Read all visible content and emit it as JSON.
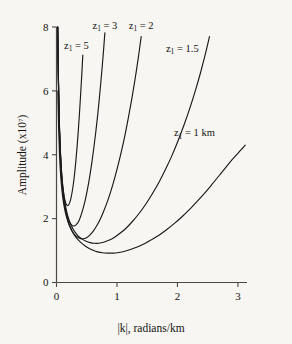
{
  "figure": {
    "background_color": "#f7f6f3",
    "line_color": "#1a1a1a",
    "axis_color": "#4a4744"
  },
  "chart_data": {
    "type": "line",
    "title": "",
    "xlabel": "|k|, radians/km",
    "ylabel": "Amplitude (x10",
    "ylabel_exponent": "7",
    "ylabel_suffix": ")",
    "xlim": [
      0,
      3.15
    ],
    "ylim": [
      0,
      8
    ],
    "xticks": [
      0,
      1,
      2,
      3
    ],
    "xtick_labels": [
      "0",
      "1",
      "2",
      "3"
    ],
    "yticks": [
      0,
      2,
      4,
      6,
      8
    ],
    "ytick_labels": [
      "0",
      "2",
      "4",
      "6",
      "8"
    ],
    "grid": false,
    "legend": "inline-curve-labels",
    "series": [
      {
        "name": "z1 = 5",
        "label_prefix": "z",
        "label_sub": "1",
        "label_value": "= 5",
        "z1": 5,
        "label_x": 0.33,
        "label_y": 7.32,
        "points": [
          [
            0.02,
            8.0
          ],
          [
            0.03,
            6.6
          ],
          [
            0.04,
            5.55
          ],
          [
            0.05,
            4.8
          ],
          [
            0.06,
            4.25
          ],
          [
            0.07,
            3.85
          ],
          [
            0.08,
            3.52
          ],
          [
            0.09,
            3.26
          ],
          [
            0.1,
            3.05
          ],
          [
            0.115,
            2.83
          ],
          [
            0.13,
            2.66
          ],
          [
            0.145,
            2.54
          ],
          [
            0.16,
            2.46
          ],
          [
            0.175,
            2.42
          ],
          [
            0.19,
            2.41
          ],
          [
            0.205,
            2.44
          ],
          [
            0.22,
            2.51
          ],
          [
            0.24,
            2.65
          ],
          [
            0.26,
            2.85
          ],
          [
            0.28,
            3.1
          ],
          [
            0.3,
            3.42
          ],
          [
            0.32,
            3.8
          ],
          [
            0.34,
            4.24
          ],
          [
            0.36,
            4.74
          ],
          [
            0.38,
            5.3
          ],
          [
            0.4,
            5.92
          ],
          [
            0.42,
            6.58
          ],
          [
            0.435,
            7.12
          ]
        ]
      },
      {
        "name": "z1 = 3",
        "label_prefix": "z",
        "label_sub": "1",
        "label_value": "= 3",
        "z1": 3,
        "label_x": 0.8,
        "label_y": 7.95,
        "points": [
          [
            0.02,
            8.0
          ],
          [
            0.03,
            6.55
          ],
          [
            0.04,
            5.45
          ],
          [
            0.05,
            4.7
          ],
          [
            0.065,
            3.9
          ],
          [
            0.08,
            3.38
          ],
          [
            0.095,
            3.0
          ],
          [
            0.11,
            2.72
          ],
          [
            0.13,
            2.46
          ],
          [
            0.15,
            2.26
          ],
          [
            0.17,
            2.11
          ],
          [
            0.19,
            2.0
          ],
          [
            0.215,
            1.89
          ],
          [
            0.24,
            1.82
          ],
          [
            0.265,
            1.78
          ],
          [
            0.29,
            1.77
          ],
          [
            0.315,
            1.79
          ],
          [
            0.345,
            1.85
          ],
          [
            0.375,
            1.95
          ],
          [
            0.405,
            2.1
          ],
          [
            0.44,
            2.32
          ],
          [
            0.475,
            2.58
          ],
          [
            0.51,
            2.9
          ],
          [
            0.545,
            3.27
          ],
          [
            0.58,
            3.7
          ],
          [
            0.615,
            4.18
          ],
          [
            0.65,
            4.72
          ],
          [
            0.685,
            5.32
          ],
          [
            0.715,
            5.9
          ],
          [
            0.745,
            6.52
          ],
          [
            0.775,
            7.2
          ],
          [
            0.8,
            7.82
          ]
        ]
      },
      {
        "name": "z1 = 2",
        "label_prefix": "z",
        "label_sub": "1",
        "label_value": "= 2",
        "z1": 2,
        "label_x": 1.4,
        "label_y": 7.95,
        "points": [
          [
            0.02,
            8.0
          ],
          [
            0.03,
            6.5
          ],
          [
            0.045,
            5.1
          ],
          [
            0.06,
            4.25
          ],
          [
            0.08,
            3.48
          ],
          [
            0.1,
            2.98
          ],
          [
            0.12,
            2.62
          ],
          [
            0.145,
            2.3
          ],
          [
            0.17,
            2.07
          ],
          [
            0.2,
            1.87
          ],
          [
            0.23,
            1.72
          ],
          [
            0.265,
            1.59
          ],
          [
            0.3,
            1.5
          ],
          [
            0.34,
            1.43
          ],
          [
            0.38,
            1.39
          ],
          [
            0.42,
            1.37
          ],
          [
            0.465,
            1.38
          ],
          [
            0.51,
            1.42
          ],
          [
            0.555,
            1.49
          ],
          [
            0.605,
            1.6
          ],
          [
            0.66,
            1.76
          ],
          [
            0.715,
            1.95
          ],
          [
            0.775,
            2.21
          ],
          [
            0.835,
            2.5
          ],
          [
            0.895,
            2.84
          ],
          [
            0.955,
            3.22
          ],
          [
            1.015,
            3.65
          ],
          [
            1.075,
            4.12
          ],
          [
            1.135,
            4.64
          ],
          [
            1.19,
            5.18
          ],
          [
            1.245,
            5.75
          ],
          [
            1.3,
            6.38
          ],
          [
            1.35,
            7.0
          ],
          [
            1.4,
            7.7
          ]
        ]
      },
      {
        "name": "z1 = 1.5",
        "label_prefix": "z",
        "label_sub": "1",
        "label_value": "= 1.5",
        "z1": 1.5,
        "label_x": 2.08,
        "label_y": 7.22,
        "points": [
          [
            0.02,
            8.0
          ],
          [
            0.032,
            6.3
          ],
          [
            0.05,
            4.8
          ],
          [
            0.07,
            3.9
          ],
          [
            0.09,
            3.32
          ],
          [
            0.115,
            2.84
          ],
          [
            0.14,
            2.5
          ],
          [
            0.17,
            2.21
          ],
          [
            0.2,
            2.0
          ],
          [
            0.24,
            1.8
          ],
          [
            0.28,
            1.65
          ],
          [
            0.325,
            1.53
          ],
          [
            0.375,
            1.43
          ],
          [
            0.43,
            1.35
          ],
          [
            0.49,
            1.29
          ],
          [
            0.555,
            1.25
          ],
          [
            0.625,
            1.23
          ],
          [
            0.7,
            1.23
          ],
          [
            0.78,
            1.26
          ],
          [
            0.865,
            1.32
          ],
          [
            0.955,
            1.41
          ],
          [
            1.05,
            1.54
          ],
          [
            1.15,
            1.7
          ],
          [
            1.255,
            1.91
          ],
          [
            1.365,
            2.16
          ],
          [
            1.475,
            2.45
          ],
          [
            1.585,
            2.78
          ],
          [
            1.695,
            3.14
          ],
          [
            1.805,
            3.55
          ],
          [
            1.91,
            3.98
          ],
          [
            2.01,
            4.44
          ],
          [
            2.11,
            4.94
          ],
          [
            2.205,
            5.46
          ],
          [
            2.295,
            6.0
          ],
          [
            2.38,
            6.56
          ],
          [
            2.46,
            7.14
          ],
          [
            2.53,
            7.7
          ]
        ]
      },
      {
        "name": "z1 = 1 km",
        "label_prefix": "z",
        "label_sub": "1",
        "label_value": "= 1 km",
        "z1": 1,
        "label_x": 2.28,
        "label_y": 4.58,
        "points": [
          [
            0.022,
            6.0
          ],
          [
            0.035,
            4.85
          ],
          [
            0.05,
            4.0
          ],
          [
            0.07,
            3.32
          ],
          [
            0.092,
            2.85
          ],
          [
            0.118,
            2.48
          ],
          [
            0.148,
            2.18
          ],
          [
            0.18,
            1.96
          ],
          [
            0.218,
            1.76
          ],
          [
            0.26,
            1.6
          ],
          [
            0.305,
            1.46
          ],
          [
            0.355,
            1.34
          ],
          [
            0.41,
            1.24
          ],
          [
            0.47,
            1.15
          ],
          [
            0.535,
            1.07
          ],
          [
            0.605,
            1.01
          ],
          [
            0.68,
            0.96
          ],
          [
            0.76,
            0.93
          ],
          [
            0.845,
            0.92
          ],
          [
            0.935,
            0.92
          ],
          [
            1.03,
            0.94
          ],
          [
            1.13,
            0.98
          ],
          [
            1.235,
            1.04
          ],
          [
            1.345,
            1.12
          ],
          [
            1.46,
            1.22
          ],
          [
            1.58,
            1.35
          ],
          [
            1.7,
            1.49
          ],
          [
            1.825,
            1.66
          ],
          [
            1.95,
            1.85
          ],
          [
            2.075,
            2.06
          ],
          [
            2.2,
            2.29
          ],
          [
            2.325,
            2.54
          ],
          [
            2.45,
            2.8
          ],
          [
            2.57,
            3.07
          ],
          [
            2.69,
            3.35
          ],
          [
            2.81,
            3.63
          ],
          [
            2.93,
            3.9
          ],
          [
            3.05,
            4.15
          ],
          [
            3.12,
            4.3
          ]
        ]
      }
    ]
  }
}
